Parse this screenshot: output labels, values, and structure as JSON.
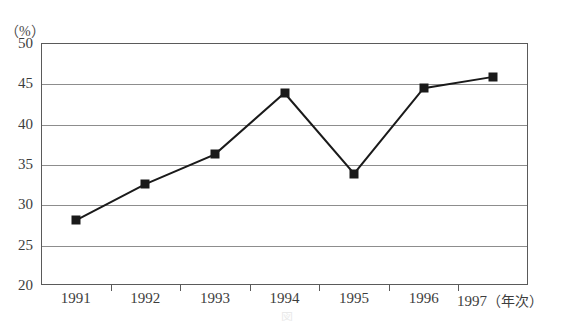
{
  "chart_data": {
    "type": "line",
    "title": "",
    "subtitle": "",
    "xlabel": "年次",
    "ylabel": "%",
    "unit_label": "（%）",
    "x_unit_label": "（年次）",
    "categories": [
      "1991",
      "1992",
      "1993",
      "1994",
      "1995",
      "1996",
      "1997"
    ],
    "values": [
      28.0,
      32.5,
      36.2,
      43.8,
      33.8,
      44.4,
      45.8
    ],
    "series": [
      {
        "name": "",
        "values": [
          28.0,
          32.5,
          36.2,
          43.8,
          33.8,
          44.4,
          45.8
        ]
      }
    ],
    "ylim": [
      20,
      50
    ],
    "yticks": [
      20,
      25,
      30,
      35,
      40,
      45,
      50
    ],
    "ytick_labels": [
      "20",
      "25",
      "30",
      "35",
      "40",
      "45",
      "50"
    ],
    "grid": true,
    "grid_axis": "y",
    "legend": false,
    "legend_position": "none",
    "marker": "square",
    "marker_color": "#1a1a1a",
    "line_color": "#1a1a1a",
    "line_width": 2,
    "frame_color": "#5a5a5a",
    "gridline_color": "#8d8d8d",
    "background": "#ffffff"
  },
  "scan_artifact": {
    "caption": "図　　　　　　　　　　　　　　　　　　　　"
  }
}
